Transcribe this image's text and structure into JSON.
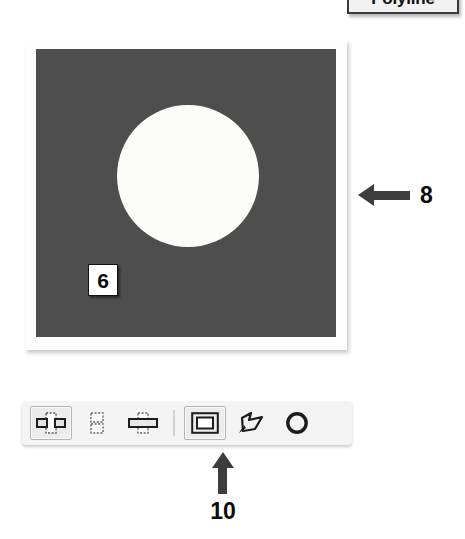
{
  "tooltip": {
    "label": "Polyline",
    "name": "polyline-tooltip"
  },
  "canvas": {
    "background_color": "#4e4e4e",
    "frame_color": "#fdfdfd",
    "shape": "circle",
    "shape_color": "#fcfcf8",
    "callout_label": "6"
  },
  "annotations": [
    {
      "number": "8",
      "direction": "left",
      "target": "canvas-frame"
    },
    {
      "number": "10",
      "direction": "up",
      "target": "toolbar-rectangle-tool"
    }
  ],
  "annotation_8": {
    "number": "8"
  },
  "annotation_10": {
    "number": "10"
  },
  "toolbar": {
    "name": "shape-tools-toolbar",
    "items": [
      {
        "name": "split-vertical-icon",
        "label": "Split Vertical",
        "selected": true
      },
      {
        "name": "stack-vertical-icon",
        "label": "Stack Vertical",
        "selected": false
      },
      {
        "name": "split-horizontal-icon",
        "label": "Split Horizontal",
        "selected": false
      },
      {
        "name": "separator",
        "label": "",
        "selected": false
      },
      {
        "name": "rectangle-tool-icon",
        "label": "Rectangle",
        "selected": true
      },
      {
        "name": "polyline-tool-icon",
        "label": "Polyline",
        "selected": false
      },
      {
        "name": "ellipse-tool-icon",
        "label": "Ellipse",
        "selected": false
      }
    ]
  }
}
